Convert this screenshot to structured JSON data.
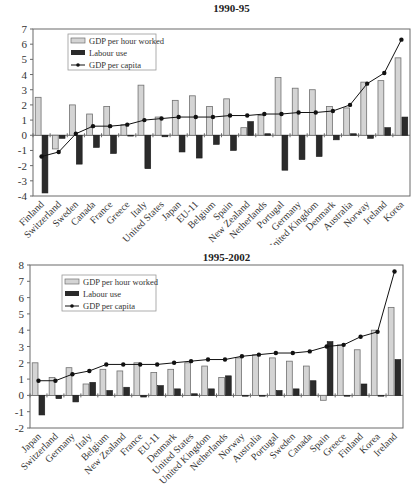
{
  "chart_data": [
    {
      "type": "bar",
      "title": "1990-95",
      "xlabel": "",
      "ylabel": "",
      "ylim": [
        -4,
        7
      ],
      "yticks": [
        7,
        6,
        5,
        4,
        3,
        2,
        1,
        0,
        -1,
        -2,
        -3,
        -4
      ],
      "grid": false,
      "legend_position": "upper-left",
      "categories": [
        "Finland",
        "Switzerland",
        "Sweden",
        "Canada",
        "France",
        "Greece",
        "Italy",
        "United States",
        "Japan",
        "EU-11",
        "Belgium",
        "Spain",
        "New Zealand",
        "Netherlands",
        "Portugal",
        "Germany",
        "United Kingdom",
        "Denmark",
        "Australia",
        "Norway",
        "Ireland",
        "Korea"
      ],
      "series": [
        {
          "name": "GDP per hour worked",
          "kind": "bar",
          "color": "#d4d4d4",
          "values": [
            2.5,
            -0.9,
            2.0,
            1.4,
            1.9,
            0.7,
            3.3,
            1.2,
            2.3,
            2.6,
            1.9,
            2.4,
            0.5,
            1.3,
            3.8,
            3.1,
            3.0,
            1.9,
            1.8,
            3.5,
            3.6,
            5.1
          ]
        },
        {
          "name": "Labour use",
          "kind": "bar",
          "color": "#2b2b2b",
          "values": [
            -3.8,
            -0.2,
            -1.9,
            -0.8,
            -1.2,
            0.0,
            -2.2,
            -0.1,
            -1.1,
            -1.5,
            -0.6,
            -1.0,
            0.9,
            0.1,
            -2.3,
            -1.6,
            -1.4,
            -0.3,
            0.1,
            -0.2,
            0.5,
            1.2
          ]
        },
        {
          "name": "GDP per capita",
          "kind": "line",
          "color": "#111111",
          "values": [
            -1.4,
            -1.1,
            0.1,
            0.6,
            0.6,
            0.7,
            1.0,
            1.1,
            1.2,
            1.2,
            1.2,
            1.3,
            1.3,
            1.4,
            1.4,
            1.5,
            1.5,
            1.6,
            2.0,
            3.4,
            4.1,
            6.3
          ]
        }
      ]
    },
    {
      "type": "bar",
      "title": "1995-2002",
      "xlabel": "",
      "ylabel": "",
      "ylim": [
        -2,
        8
      ],
      "yticks": [
        8,
        7,
        6,
        5,
        4,
        3,
        2,
        1,
        0,
        -1,
        -2
      ],
      "grid": false,
      "legend_position": "upper-left",
      "categories": [
        "Japan",
        "Switzerland",
        "Germany",
        "Italy",
        "Belgium",
        "New Zealand",
        "France",
        "EU-11",
        "Denmark",
        "United States",
        "United Kingdom",
        "Netherlands",
        "Norway",
        "Australia",
        "Portugal",
        "Sweden",
        "Canada",
        "Spain",
        "Greece",
        "Finland",
        "Korea",
        "Ireland"
      ],
      "series": [
        {
          "name": "GDP per hour worked",
          "kind": "bar",
          "color": "#d4d4d4",
          "values": [
            2.0,
            1.1,
            1.7,
            0.7,
            1.6,
            1.5,
            2.0,
            1.4,
            1.6,
            2.0,
            1.8,
            1.1,
            2.3,
            2.5,
            2.3,
            2.1,
            1.8,
            -0.3,
            3.1,
            2.8,
            4.0,
            5.4
          ]
        },
        {
          "name": "Labour use",
          "kind": "bar",
          "color": "#2b2b2b",
          "values": [
            -1.2,
            -0.2,
            -0.4,
            0.8,
            0.3,
            0.5,
            -0.1,
            0.6,
            0.4,
            0.1,
            0.4,
            1.2,
            0.0,
            0.0,
            0.3,
            0.4,
            0.9,
            3.3,
            0.0,
            0.7,
            0.0,
            2.2
          ]
        },
        {
          "name": "GDP per capita",
          "kind": "line",
          "color": "#111111",
          "values": [
            0.9,
            0.9,
            1.3,
            1.5,
            1.9,
            1.9,
            1.9,
            1.9,
            2.0,
            2.1,
            2.2,
            2.2,
            2.4,
            2.5,
            2.6,
            2.6,
            2.7,
            3.0,
            3.1,
            3.6,
            3.9,
            7.6
          ]
        }
      ]
    }
  ],
  "legend": {
    "gdp_per_hour": "GDP per hour worked",
    "labour_use": "Labour use",
    "gdp_per_capita": "GDP per capita"
  },
  "colors": {
    "hour_bar": "#d4d4d4",
    "labour_bar": "#2b2b2b",
    "line": "#111111",
    "axis": "#6a6a6a"
  }
}
